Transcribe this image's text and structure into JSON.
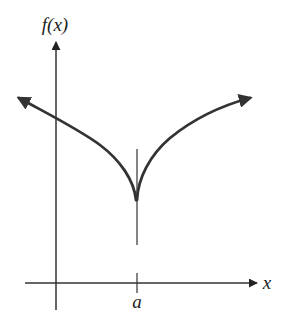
{
  "diagram": {
    "y_axis_label": "f(x)",
    "x_axis_label": "x",
    "tick_label": "a",
    "colors": {
      "curve": "#333333",
      "axes": "#333333",
      "background": "#ffffff"
    },
    "features": {
      "cusp_at": "a",
      "vertical_tangent_line": true,
      "curve_arrows": [
        "left",
        "right"
      ]
    }
  }
}
